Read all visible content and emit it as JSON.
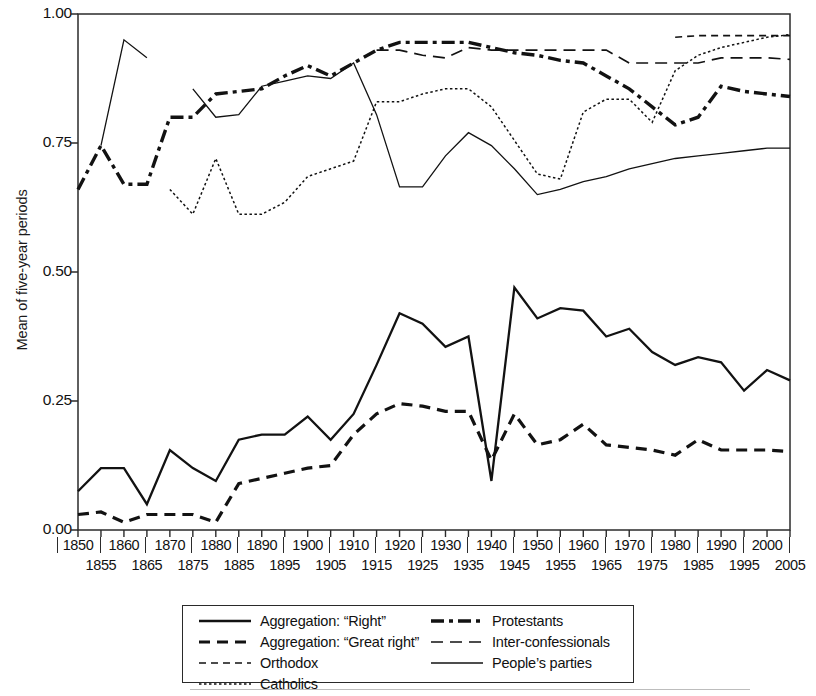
{
  "axes": {
    "ylabel": "Mean of five-year periods",
    "yticks": [
      "0.00",
      "0.25",
      "0.50",
      "0.75",
      "1.00"
    ],
    "ytick_values": [
      0.0,
      0.25,
      0.5,
      0.75,
      1.0
    ],
    "xticks_upper": [
      "1850",
      "1860",
      "1870",
      "1880",
      "1890",
      "1900",
      "1910",
      "1920",
      "1930",
      "1940",
      "1950",
      "1960",
      "1970",
      "1980",
      "1990",
      "2000"
    ],
    "xticks_lower": [
      "1855",
      "1865",
      "1875",
      "1885",
      "1895",
      "1905",
      "1915",
      "1925",
      "1935",
      "1945",
      "1955",
      "1965",
      "1975",
      "1985",
      "1995",
      "2005"
    ]
  },
  "legend": {
    "left_column": [
      {
        "label": "Aggregation: “Right”",
        "style": "solid-thick",
        "key": "legend-key-aggregation-right"
      },
      {
        "label": "Aggregation: “Great right”",
        "style": "dashed-thick",
        "key": "legend-key-aggregation-great-right"
      },
      {
        "label": "Orthodox",
        "style": "dashed-thin",
        "key": "legend-key-orthodox"
      },
      {
        "label": "Catholics",
        "style": "dotted-thin",
        "key": "legend-key-catholics"
      }
    ],
    "right_column": [
      {
        "label": "Protestants",
        "style": "dashdot-thick",
        "key": "legend-key-protestants"
      },
      {
        "label": "Inter-confessionals",
        "style": "longdash-thin",
        "key": "legend-key-inter-confessionals"
      },
      {
        "label": "People’s parties",
        "style": "solid-thin",
        "key": "legend-key-peoples-parties"
      }
    ]
  },
  "chart_data": {
    "type": "line",
    "title": "",
    "xlabel": "",
    "ylabel": "Mean of five-year periods",
    "xlim": [
      1850,
      2005
    ],
    "ylim": [
      0.0,
      1.0
    ],
    "grid": false,
    "legend_position": "below-axes",
    "x": [
      1850,
      1855,
      1860,
      1865,
      1870,
      1875,
      1880,
      1885,
      1890,
      1895,
      1900,
      1905,
      1910,
      1915,
      1920,
      1925,
      1930,
      1935,
      1940,
      1945,
      1950,
      1955,
      1960,
      1965,
      1970,
      1975,
      1980,
      1985,
      1990,
      1995,
      2000,
      2005
    ],
    "series": [
      {
        "name": "Aggregation: “Right”",
        "style": "solid-thick",
        "values": [
          0.075,
          0.12,
          0.12,
          0.05,
          0.155,
          0.12,
          0.095,
          0.175,
          0.185,
          0.185,
          0.22,
          0.175,
          0.225,
          0.32,
          0.42,
          0.4,
          0.355,
          0.375,
          0.095,
          0.47,
          0.41,
          0.43,
          0.425,
          0.375,
          0.39,
          0.345,
          0.32,
          0.335,
          0.325,
          0.27,
          0.31,
          0.29
        ]
      },
      {
        "name": "Aggregation: “Great right”",
        "style": "dashed-thick",
        "values": [
          0.03,
          0.035,
          0.015,
          0.03,
          0.03,
          0.03,
          0.015,
          0.09,
          0.1,
          0.11,
          0.12,
          0.125,
          0.185,
          0.225,
          0.245,
          0.24,
          0.23,
          0.23,
          0.135,
          0.225,
          0.165,
          0.175,
          0.205,
          0.165,
          0.16,
          0.155,
          0.145,
          0.175,
          0.155,
          0.155,
          0.155,
          0.152
        ]
      },
      {
        "name": "Protestants",
        "style": "dashdot-thick",
        "values": [
          0.66,
          0.745,
          0.67,
          0.67,
          0.8,
          0.8,
          0.845,
          0.85,
          0.855,
          0.88,
          0.9,
          0.88,
          0.905,
          0.93,
          0.945,
          0.945,
          0.945,
          0.945,
          0.935,
          0.925,
          0.92,
          0.91,
          0.905,
          0.88,
          0.855,
          0.82,
          0.785,
          0.8,
          0.86,
          0.85,
          0.845,
          0.84
        ]
      },
      {
        "name": "Catholics",
        "style": "dotted-thin",
        "values": [
          null,
          null,
          null,
          null,
          0.66,
          0.612,
          0.72,
          0.612,
          0.612,
          0.635,
          0.685,
          0.7,
          0.715,
          0.83,
          0.83,
          0.845,
          0.855,
          0.855,
          0.82,
          0.755,
          0.69,
          0.68,
          0.81,
          0.835,
          0.835,
          0.79,
          0.89,
          0.92,
          0.935,
          0.945,
          0.955,
          0.96
        ]
      },
      {
        "name": "Inter-confessionals",
        "style": "longdash-thin",
        "values": [
          null,
          null,
          null,
          null,
          null,
          null,
          null,
          null,
          null,
          null,
          null,
          null,
          null,
          0.93,
          0.93,
          0.92,
          0.915,
          0.935,
          0.93,
          0.93,
          0.93,
          0.93,
          0.93,
          0.93,
          0.905,
          0.905,
          0.905,
          0.905,
          0.915,
          0.915,
          0.915,
          0.912
        ]
      },
      {
        "name": "Orthodox",
        "style": "dashed-thin",
        "values": [
          null,
          null,
          null,
          null,
          null,
          null,
          null,
          null,
          null,
          null,
          null,
          null,
          null,
          null,
          null,
          null,
          null,
          null,
          null,
          null,
          null,
          null,
          null,
          null,
          null,
          null,
          0.955,
          0.958,
          0.958,
          0.958,
          0.958,
          0.958
        ]
      },
      {
        "name": "People’s parties",
        "style": "solid-thin",
        "values": [
          null,
          0.745,
          0.95,
          0.915,
          null,
          0.855,
          0.8,
          0.805,
          0.86,
          0.87,
          0.88,
          0.875,
          0.905,
          0.805,
          0.665,
          0.665,
          0.725,
          0.77,
          0.745,
          0.7,
          0.65,
          0.66,
          0.675,
          0.685,
          0.7,
          0.71,
          0.72,
          0.725,
          0.73,
          0.735,
          0.74,
          0.74
        ]
      }
    ]
  }
}
